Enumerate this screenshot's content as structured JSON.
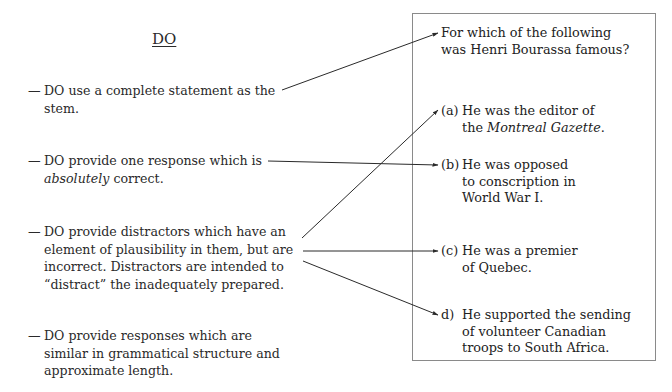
{
  "left_column": {
    "heading": "DO",
    "items": [
      {
        "dash": "—",
        "lines": [
          "DO use a complete statement as the",
          "stem."
        ]
      },
      {
        "dash": "—",
        "pre": "DO provide one response which is",
        "italic": "absolutely",
        "post": " correct."
      },
      {
        "dash": "—",
        "lines": [
          "DO provide distractors which have an",
          "element of plausibility in them, but are",
          "incorrect. Distractors are intended to",
          "“distract” the inadequately prepared."
        ]
      },
      {
        "dash": "—",
        "lines": [
          "DO provide responses which are",
          "similar in grammatical structure and",
          "approximate length."
        ]
      }
    ]
  },
  "example_box": {
    "question": [
      "For which of the following",
      "was Henri Bourassa famous?"
    ],
    "options": [
      {
        "label": "(a)",
        "pre": "He was the editor of",
        "line2_pre": "the ",
        "line2_italic": "Montreal Gazette",
        "line2_post": "."
      },
      {
        "label": "(b)",
        "lines": [
          "He was opposed",
          "to conscription in",
          "World War I."
        ]
      },
      {
        "label": "(c)",
        "lines": [
          "He was a premier",
          "of Quebec."
        ]
      },
      {
        "label": "d)",
        "lines": [
          "He supported the sending",
          "of volunteer Canadian",
          "troops to South Africa."
        ]
      }
    ]
  },
  "arrows": {
    "color": "#2a2a2a",
    "connections": [
      {
        "from": "complete-statement",
        "to": "question"
      },
      {
        "from": "one-correct-response",
        "to": "option-b"
      },
      {
        "from": "distractors",
        "to": "option-a"
      },
      {
        "from": "distractors",
        "to": "option-c"
      },
      {
        "from": "distractors",
        "to": "option-d"
      }
    ]
  }
}
